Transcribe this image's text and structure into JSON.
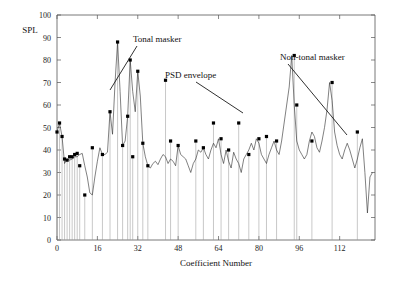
{
  "figure": {
    "y_axis_label": "SPL",
    "x_axis_label": "Coefficient Number"
  },
  "annotations": [
    {
      "name": "tonal-masker",
      "text": "Tonal masker",
      "x": 133,
      "y": 42,
      "leader": [
        [
          137,
          46
        ],
        [
          110,
          90
        ]
      ]
    },
    {
      "name": "psd-envelope",
      "text": "PSD envelope",
      "x": 165,
      "y": 78,
      "leader": [
        [
          196,
          82
        ],
        [
          243,
          113
        ]
      ]
    },
    {
      "name": "non-tonal-masker",
      "text": "Non-tonal masker",
      "x": 280,
      "y": 60,
      "leader": [
        [
          288,
          64
        ],
        [
          347,
          135
        ]
      ]
    }
  ],
  "chart_data": {
    "type": "line",
    "title": "",
    "xlabel": "Coefficient Number",
    "ylabel": "SPL",
    "xlim": [
      0,
      126
    ],
    "ylim": [
      0,
      100
    ],
    "xticks": [
      0,
      16,
      32,
      48,
      64,
      80,
      96,
      112
    ],
    "yticks": [
      0,
      10,
      20,
      30,
      40,
      50,
      60,
      70,
      80,
      90,
      100
    ],
    "grid": false,
    "legend_position": "none",
    "series": [
      {
        "name": "PSD envelope",
        "type": "line",
        "x": [
          0,
          1,
          2,
          3,
          4,
          5,
          6,
          7,
          8,
          9,
          10,
          11,
          12,
          13,
          14,
          15,
          16,
          17,
          18,
          19,
          20,
          21,
          22,
          23,
          24,
          25,
          26,
          27,
          28,
          29,
          30,
          31,
          32,
          33,
          34,
          35,
          36,
          37,
          38,
          39,
          40,
          41,
          42,
          43,
          44,
          45,
          46,
          47,
          48,
          49,
          50,
          51,
          52,
          53,
          54,
          55,
          56,
          57,
          58,
          59,
          60,
          61,
          62,
          63,
          64,
          65,
          66,
          67,
          68,
          69,
          70,
          71,
          72,
          73,
          74,
          75,
          76,
          77,
          78,
          79,
          80,
          81,
          82,
          83,
          84,
          85,
          86,
          87,
          88,
          89,
          90,
          91,
          92,
          93,
          94,
          95,
          96,
          97,
          98,
          99,
          100,
          101,
          102,
          103,
          104,
          105,
          106,
          107,
          108,
          109,
          110,
          111,
          112,
          113,
          114,
          115,
          116,
          117,
          118,
          119,
          120,
          121,
          122,
          123,
          124,
          125
        ],
        "y": [
          48,
          52,
          46,
          34,
          36,
          35.5,
          36,
          37,
          37,
          38,
          38.5,
          33,
          28,
          21,
          20,
          28,
          35,
          41,
          38,
          38,
          39,
          57,
          47,
          70,
          88,
          66,
          42,
          44,
          55,
          80,
          66,
          57,
          75,
          64,
          43,
          37,
          33,
          32,
          34,
          35,
          33.5,
          36,
          38,
          37,
          34,
          36,
          35,
          33,
          42,
          38,
          37,
          36,
          33,
          30,
          34,
          36,
          40,
          39,
          41,
          38,
          36,
          40,
          43,
          41,
          45,
          38,
          34,
          40,
          35,
          32,
          39,
          36,
          34,
          30,
          36,
          38,
          40,
          43,
          40,
          45,
          43,
          38,
          36,
          34,
          38,
          41,
          44,
          40,
          38,
          44,
          52,
          60,
          68,
          82,
          60,
          44,
          40,
          38,
          36,
          38,
          44,
          48,
          46,
          41,
          39,
          44,
          50,
          58,
          70,
          62,
          48,
          42,
          38,
          36,
          40,
          43,
          40,
          36,
          32,
          36,
          41,
          45,
          30,
          12,
          28,
          30
        ]
      },
      {
        "name": "Maskers (stems)",
        "type": "stem",
        "points": [
          {
            "x": 0,
            "y": 48,
            "kind": "non-tonal"
          },
          {
            "x": 1,
            "y": 52,
            "kind": "tonal"
          },
          {
            "x": 2,
            "y": 46,
            "kind": "tonal"
          },
          {
            "x": 3,
            "y": 36,
            "kind": "non-tonal"
          },
          {
            "x": 4,
            "y": 35.5,
            "kind": "non-tonal"
          },
          {
            "x": 5,
            "y": 37,
            "kind": "tonal"
          },
          {
            "x": 6,
            "y": 37,
            "kind": "tonal"
          },
          {
            "x": 7,
            "y": 38,
            "kind": "tonal"
          },
          {
            "x": 8,
            "y": 38.5,
            "kind": "tonal"
          },
          {
            "x": 9,
            "y": 33,
            "kind": "non-tonal"
          },
          {
            "x": 11,
            "y": 20,
            "kind": "non-tonal"
          },
          {
            "x": 14,
            "y": 41,
            "kind": "tonal"
          },
          {
            "x": 18,
            "y": 38,
            "kind": "non-tonal"
          },
          {
            "x": 21,
            "y": 57,
            "kind": "tonal"
          },
          {
            "x": 24,
            "y": 88,
            "kind": "tonal"
          },
          {
            "x": 26,
            "y": 42,
            "kind": "non-tonal"
          },
          {
            "x": 28,
            "y": 55,
            "kind": "tonal"
          },
          {
            "x": 29,
            "y": 80,
            "kind": "tonal"
          },
          {
            "x": 30,
            "y": 37,
            "kind": "non-tonal"
          },
          {
            "x": 32,
            "y": 75,
            "kind": "tonal"
          },
          {
            "x": 34,
            "y": 43,
            "kind": "non-tonal"
          },
          {
            "x": 36,
            "y": 33,
            "kind": "non-tonal"
          },
          {
            "x": 43,
            "y": 71,
            "kind": "tonal"
          },
          {
            "x": 45,
            "y": 44,
            "kind": "non-tonal"
          },
          {
            "x": 48,
            "y": 42,
            "kind": "non-tonal"
          },
          {
            "x": 55,
            "y": 44,
            "kind": "non-tonal"
          },
          {
            "x": 58,
            "y": 41,
            "kind": "tonal"
          },
          {
            "x": 62,
            "y": 52,
            "kind": "tonal"
          },
          {
            "x": 65,
            "y": 45,
            "kind": "non-tonal"
          },
          {
            "x": 68,
            "y": 40,
            "kind": "non-tonal"
          },
          {
            "x": 72,
            "y": 52,
            "kind": "tonal"
          },
          {
            "x": 76,
            "y": 38,
            "kind": "non-tonal"
          },
          {
            "x": 80,
            "y": 45,
            "kind": "non-tonal"
          },
          {
            "x": 83,
            "y": 46,
            "kind": "tonal"
          },
          {
            "x": 87,
            "y": 44,
            "kind": "non-tonal"
          },
          {
            "x": 94,
            "y": 82,
            "kind": "tonal"
          },
          {
            "x": 95,
            "y": 60,
            "kind": "non-tonal"
          },
          {
            "x": 101,
            "y": 44,
            "kind": "non-tonal"
          },
          {
            "x": 109,
            "y": 70,
            "kind": "tonal"
          },
          {
            "x": 119,
            "y": 48,
            "kind": "non-tonal"
          }
        ]
      }
    ]
  }
}
